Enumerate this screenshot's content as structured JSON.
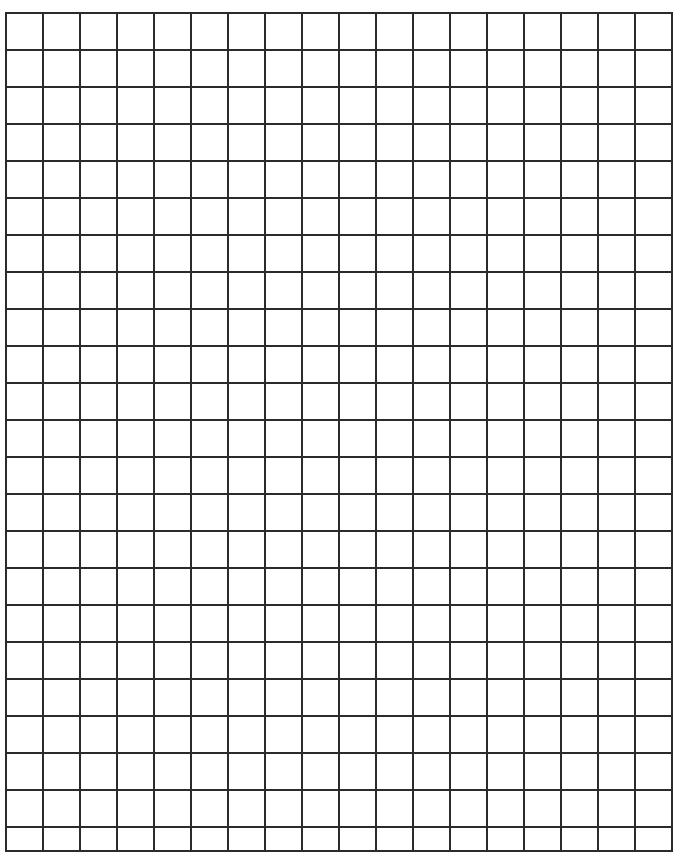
{
  "document": {
    "kind": "grid-paper",
    "title": "Blank Graph Paper Grid",
    "description": "A blank sheet of square grid (graph) paper with uniform dark ruled lines and no text, labels, or annotations.",
    "background_color": "#ffffff",
    "page_width": 675,
    "page_height": 858
  },
  "grid": {
    "line_color": "#2b2b2b",
    "line_width": 2.0,
    "cell_size": 37,
    "origin_x": 5,
    "origin_y": 12,
    "columns": 18,
    "rows": 23,
    "last_row_partial": true,
    "last_row_height": 24,
    "grid_width": 666,
    "grid_height": 835,
    "right_edge_x": 671,
    "bottom_edge_y": 847,
    "vertical_line_count": 19,
    "horizontal_line_count": 24
  },
  "chart_data": {
    "type": "table",
    "xlabel": "",
    "ylabel": "",
    "columns": 18,
    "rows": 23,
    "cell_size_px": 37,
    "values": [],
    "categories": []
  },
  "annotations": {
    "text_items": [],
    "count": 0
  }
}
